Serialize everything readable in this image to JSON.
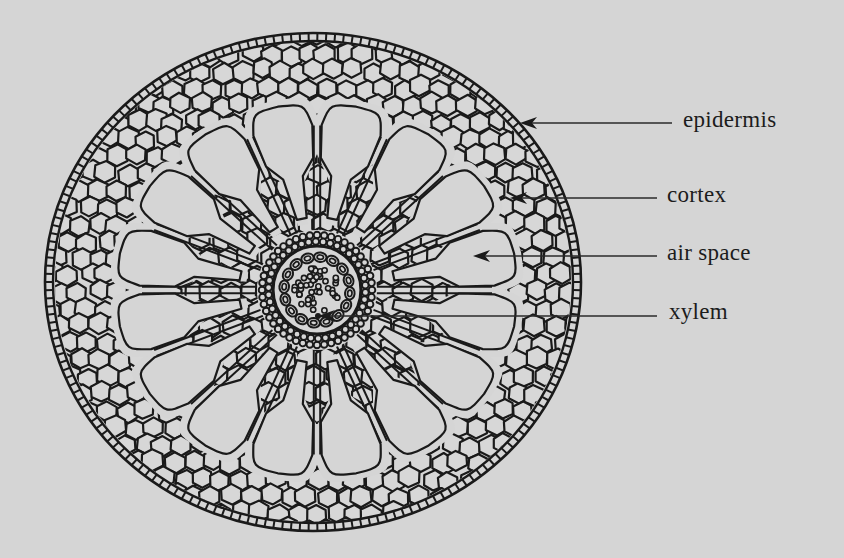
{
  "figure": {
    "type": "root cross-section diagram",
    "background_color": "#d5d5d5",
    "ink_color": "#1a1a1a",
    "section": {
      "center": [
        313,
        282
      ],
      "rx": 268,
      "ry": 249,
      "air_space_lobes": 16,
      "stele_center": [
        317,
        290
      ],
      "stele_radius": 57
    }
  },
  "labels": [
    {
      "id": "epidermis",
      "text": "epidermis",
      "x": 683,
      "y": 110,
      "line": {
        "x1": 672,
        "y1": 123,
        "x2": 520,
        "y2": 123
      },
      "arrow": true
    },
    {
      "id": "cortex",
      "text": "cortex",
      "x": 667,
      "y": 185,
      "line": {
        "x1": 657,
        "y1": 198,
        "x2": 510,
        "y2": 198
      },
      "arrow": true
    },
    {
      "id": "air-space",
      "text": "air space",
      "x": 667,
      "y": 243,
      "line": {
        "x1": 657,
        "y1": 256,
        "x2": 473,
        "y2": 256
      },
      "arrow": true
    },
    {
      "id": "xylem",
      "text": "xylem",
      "x": 669,
      "y": 302,
      "line": {
        "x1": 657,
        "y1": 316,
        "x2": 318,
        "y2": 316
      },
      "arrow": true
    }
  ]
}
